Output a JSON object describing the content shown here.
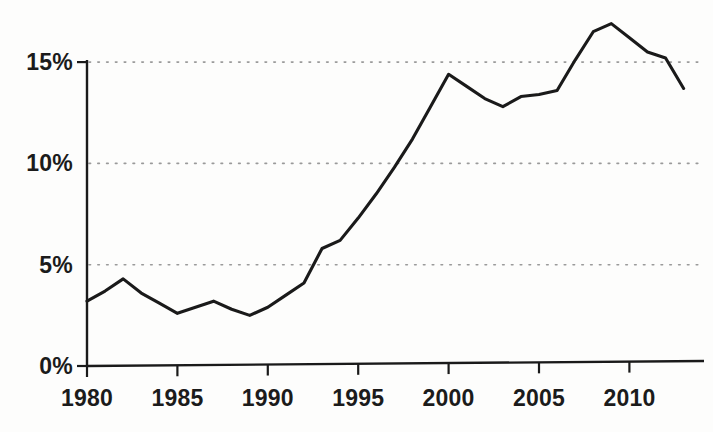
{
  "chart_data": {
    "type": "line",
    "title": "",
    "subtitle": "",
    "xlabel": "",
    "ylabel": "",
    "xlim": [
      1980,
      2013
    ],
    "ylim": [
      0,
      17.6
    ],
    "grid": true,
    "grid_style": "dotted-horizontal",
    "legend": null,
    "line_color": "#1a1a1a",
    "background_color": "#fdfdfc",
    "axis_color": "#1a1a1a",
    "gridline_color": "#9a9a9a",
    "x_ticks": [
      1980,
      1985,
      1990,
      1995,
      2000,
      2005,
      2010
    ],
    "x_tick_labels": [
      "1980",
      "1985",
      "1990",
      "1995",
      "2000",
      "2005",
      "2010"
    ],
    "y_ticks": [
      0,
      5,
      10,
      15
    ],
    "y_tick_labels": [
      "0%",
      "5%",
      "10%",
      "15%"
    ],
    "series": [
      {
        "name": "",
        "x": [
          1980,
          1981,
          1982,
          1983,
          1984,
          1985,
          1986,
          1987,
          1988,
          1989,
          1990,
          1991,
          1992,
          1993,
          1994,
          1995,
          1996,
          1997,
          1998,
          1999,
          2000,
          2001,
          2002,
          2003,
          2004,
          2005,
          2006,
          2007,
          2008,
          2009,
          2010,
          2011,
          2012,
          2013
        ],
        "values": [
          3.2,
          3.7,
          4.3,
          3.6,
          3.1,
          2.6,
          2.9,
          3.2,
          2.8,
          2.5,
          2.9,
          3.5,
          4.1,
          5.8,
          6.2,
          7.3,
          8.5,
          9.8,
          11.2,
          12.8,
          14.4,
          13.8,
          13.2,
          12.8,
          13.3,
          13.4,
          13.6,
          15.1,
          16.5,
          16.9,
          16.2,
          15.5,
          15.2,
          13.7
        ]
      }
    ]
  },
  "axes": {
    "y_axis_name": "percent-axis",
    "x_axis_name": "year-axis"
  }
}
